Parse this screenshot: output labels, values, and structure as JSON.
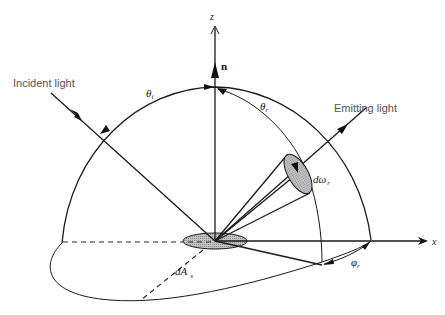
{
  "diagram": {
    "labels": {
      "incident_light": "Incident light",
      "emitting_light": "Emitting light",
      "z_axis": "z",
      "x_axis": "x",
      "normal": "n",
      "theta_i": "θ",
      "theta_i_sub": "i",
      "theta_r": "θ",
      "theta_r_sub": "r",
      "d_omega_r": "dω",
      "d_omega_r_sub": "r",
      "phi_r": "φ",
      "phi_r_sub": "r",
      "d_a_s": "dA",
      "d_a_s_sub": "s"
    },
    "colors": {
      "line": "#1a1a1a",
      "patch_fill": "#bdbdbd",
      "label_gray": "#555555",
      "background": "#ffffff"
    }
  }
}
